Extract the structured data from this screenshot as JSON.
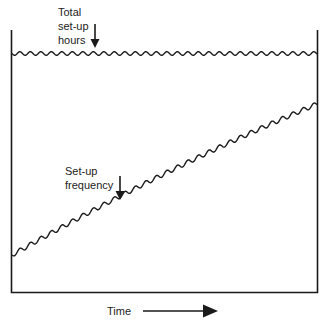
{
  "diagram": {
    "labels": {
      "total_setup_hours": [
        "Total",
        "set-up",
        "hours"
      ],
      "setup_frequency": [
        "Set-up",
        "frequency"
      ],
      "x_axis": "Time"
    },
    "lines": [
      {
        "name": "Total set-up hours",
        "shape": "wavy horizontal",
        "level": "constant"
      },
      {
        "name": "Set-up frequency",
        "shape": "wavy rising",
        "trend": "increasing over time"
      }
    ],
    "colors": {
      "ink": "#1a1a1a",
      "background": "#ffffff"
    }
  }
}
